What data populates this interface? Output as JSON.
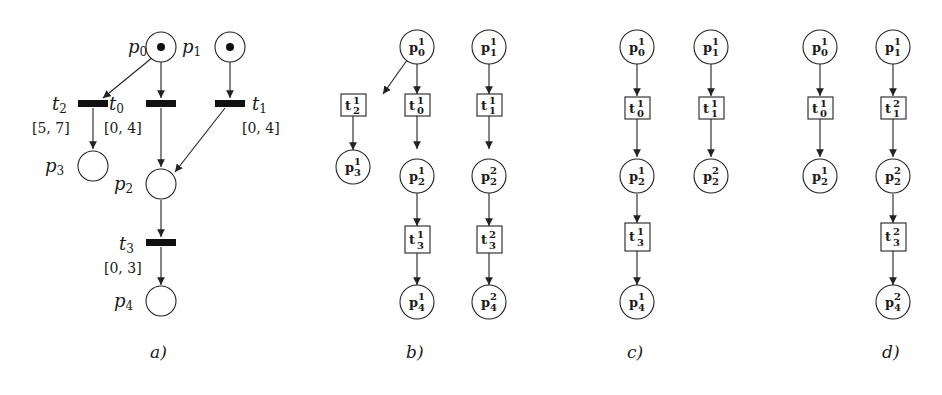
{
  "figure": {
    "panels": [
      {
        "id": "a",
        "caption": "a)",
        "places": [
          {
            "id": "p0",
            "label": "p",
            "sub": "0",
            "token": true
          },
          {
            "id": "p1",
            "label": "p",
            "sub": "1",
            "token": true
          },
          {
            "id": "p2",
            "label": "p",
            "sub": "2",
            "token": false
          },
          {
            "id": "p3",
            "label": "p",
            "sub": "3",
            "token": false
          },
          {
            "id": "p4",
            "label": "p",
            "sub": "4",
            "token": false
          }
        ],
        "transitions": [
          {
            "id": "t0",
            "label": "t",
            "sub": "0",
            "interval": "[0, 4]"
          },
          {
            "id": "t1",
            "label": "t",
            "sub": "1",
            "interval": "[0, 4]"
          },
          {
            "id": "t2",
            "label": "t",
            "sub": "2",
            "interval": "[5, 7]"
          },
          {
            "id": "t3",
            "label": "t",
            "sub": "3",
            "interval": "[0, 3]"
          }
        ],
        "arcs": [
          [
            "p0",
            "t2"
          ],
          [
            "p0",
            "t0"
          ],
          [
            "p1",
            "t1"
          ],
          [
            "t2",
            "p3"
          ],
          [
            "t0",
            "p2"
          ],
          [
            "t1",
            "p2"
          ],
          [
            "p2",
            "t3"
          ],
          [
            "t3",
            "p4"
          ]
        ]
      },
      {
        "id": "b",
        "caption": "b)",
        "nodes": {
          "p0_1": {
            "base": "p",
            "sup": "1",
            "sub": "0"
          },
          "p1_1": {
            "base": "p",
            "sup": "1",
            "sub": "1"
          },
          "t2_1": {
            "base": "t",
            "sup": "1",
            "sub": "2"
          },
          "t0_1": {
            "base": "t",
            "sup": "1",
            "sub": "0"
          },
          "t1_1": {
            "base": "t",
            "sup": "1",
            "sub": "1"
          },
          "p3_1": {
            "base": "p",
            "sup": "1",
            "sub": "3"
          },
          "p2_1": {
            "base": "p",
            "sup": "1",
            "sub": "2"
          },
          "p2_2": {
            "base": "p",
            "sup": "2",
            "sub": "2"
          },
          "t3_1": {
            "base": "t",
            "sup": "1",
            "sub": "3"
          },
          "t3_2": {
            "base": "t",
            "sup": "2",
            "sub": "3"
          },
          "p4_1": {
            "base": "p",
            "sup": "1",
            "sub": "4"
          },
          "p4_2": {
            "base": "p",
            "sup": "2",
            "sub": "4"
          }
        }
      },
      {
        "id": "c",
        "caption": "c)",
        "nodes": {
          "p0_1": {
            "base": "p",
            "sup": "1",
            "sub": "0"
          },
          "p1_1": {
            "base": "p",
            "sup": "1",
            "sub": "1"
          },
          "t0_1": {
            "base": "t",
            "sup": "1",
            "sub": "0"
          },
          "t1_1": {
            "base": "t",
            "sup": "1",
            "sub": "1"
          },
          "p2_1": {
            "base": "p",
            "sup": "1",
            "sub": "2"
          },
          "p2_2": {
            "base": "p",
            "sup": "2",
            "sub": "2"
          },
          "t3_1": {
            "base": "t",
            "sup": "1",
            "sub": "3"
          },
          "p4_1": {
            "base": "p",
            "sup": "1",
            "sub": "4"
          }
        }
      },
      {
        "id": "d",
        "caption": "d)",
        "nodes": {
          "p0_1": {
            "base": "p",
            "sup": "1",
            "sub": "0"
          },
          "p1_1": {
            "base": "p",
            "sup": "1",
            "sub": "1"
          },
          "t0_1": {
            "base": "t",
            "sup": "1",
            "sub": "0"
          },
          "t1_2": {
            "base": "t",
            "sup": "2",
            "sub": "1"
          },
          "p2_1": {
            "base": "p",
            "sup": "1",
            "sub": "2"
          },
          "p2_2": {
            "base": "p",
            "sup": "2",
            "sub": "2"
          },
          "t3_2": {
            "base": "t",
            "sup": "2",
            "sub": "3"
          },
          "p4_2": {
            "base": "p",
            "sup": "2",
            "sub": "4"
          }
        }
      }
    ]
  }
}
